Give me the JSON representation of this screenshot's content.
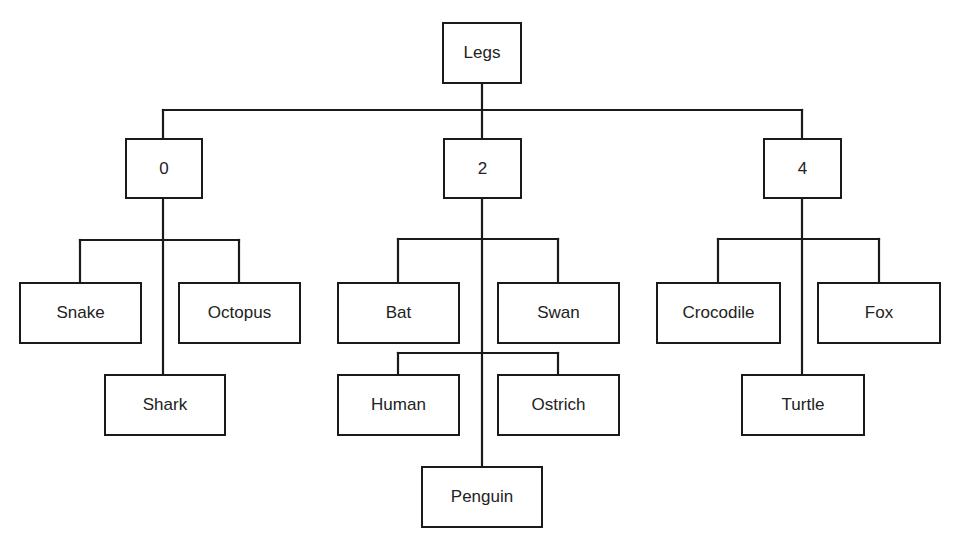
{
  "diagram": {
    "type": "tree",
    "title": "Legs",
    "root": {
      "label": "Legs",
      "box": [
        442,
        22,
        80,
        62
      ]
    },
    "groups": [
      {
        "label": "0",
        "box": [
          125,
          138,
          78,
          61
        ],
        "children": [
          {
            "label": "Snake",
            "box": [
              19,
              282,
              123,
              62
            ]
          },
          {
            "label": "Octopus",
            "box": [
              178,
              282,
              123,
              62
            ]
          },
          {
            "label": "Shark",
            "box": [
              104,
              374,
              122,
              62
            ]
          }
        ]
      },
      {
        "label": "2",
        "box": [
          443,
          138,
          79,
          61
        ],
        "children": [
          {
            "label": "Bat",
            "box": [
              337,
              282,
              123,
              62
            ]
          },
          {
            "label": "Swan",
            "box": [
              497,
              282,
              123,
              62
            ]
          },
          {
            "label": "Human",
            "box": [
              337,
              374,
              123,
              62
            ]
          },
          {
            "label": "Ostrich",
            "box": [
              497,
              374,
              123,
              62
            ]
          },
          {
            "label": "Penguin",
            "box": [
              421,
              466,
              122,
              62
            ]
          }
        ]
      },
      {
        "label": "4",
        "box": [
          763,
          138,
          79,
          61
        ],
        "children": [
          {
            "label": "Crocodile",
            "box": [
              656,
              282,
              125,
              62
            ]
          },
          {
            "label": "Fox",
            "box": [
              817,
              282,
              124,
              62
            ]
          },
          {
            "label": "Turtle",
            "box": [
              741,
              374,
              124,
              62
            ]
          }
        ]
      }
    ],
    "colors": {
      "stroke": "#1a1a1a",
      "text": "#222222",
      "background": "#ffffff"
    }
  }
}
